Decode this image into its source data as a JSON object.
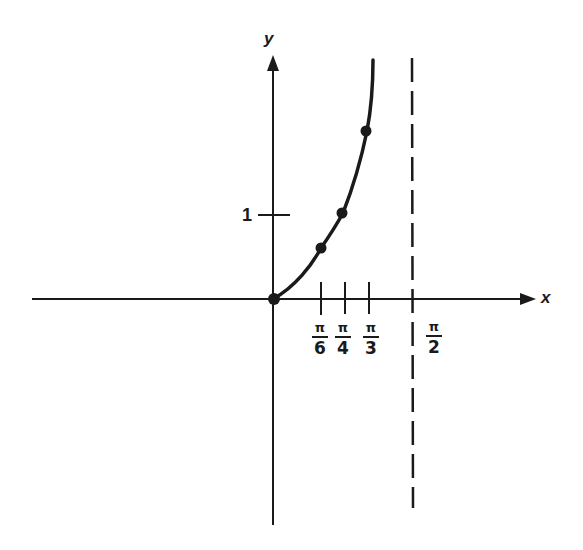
{
  "diagram": {
    "x_axis": {
      "label": "x"
    },
    "y_axis": {
      "label": "y"
    },
    "y_ticks": [
      {
        "label": "1",
        "value": 1
      }
    ],
    "x_ticks": [
      {
        "numerator": "π",
        "denominator": "6",
        "value": 0.5236
      },
      {
        "numerator": "π",
        "denominator": "4",
        "value": 0.7854
      },
      {
        "numerator": "π",
        "denominator": "3",
        "value": 1.0472
      }
    ],
    "asymptote": {
      "numerator": "π",
      "denominator": "2",
      "value": 1.5708,
      "style": "dashed"
    },
    "points": [
      {
        "x": "0",
        "y": 0
      },
      {
        "x": "π/6",
        "y": 0.577
      },
      {
        "x": "π/4",
        "y": 1
      },
      {
        "x": "π/3",
        "y": 1.732
      }
    ],
    "colors": {
      "ink": "#1a1a1a",
      "background": "#ffffff"
    }
  }
}
